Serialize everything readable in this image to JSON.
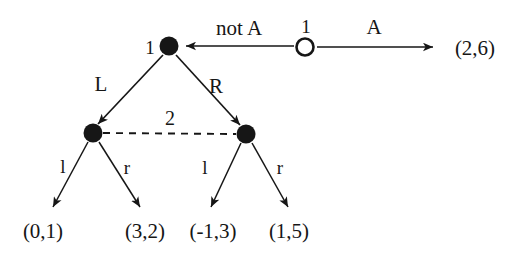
{
  "figure": {
    "name": "extensive-form-game-tree",
    "background_color": "#ffffff",
    "ink_color": "#161616"
  },
  "nodes": [
    {
      "id": "root",
      "name": "root-node-player1",
      "shape": "hollow-circle",
      "player_label": "1",
      "x": 305,
      "y": 47
    },
    {
      "id": "n1",
      "name": "decision-node-player1",
      "shape": "filled-circle",
      "player_label": "1",
      "x": 169,
      "y": 46
    },
    {
      "id": "n2l",
      "name": "decision-node-player2-left",
      "shape": "filled-circle",
      "player_label": "",
      "x": 93,
      "y": 133
    },
    {
      "id": "n2r",
      "name": "decision-node-player2-right",
      "shape": "filled-circle",
      "player_label": "",
      "x": 246,
      "y": 134
    }
  ],
  "edges": [
    {
      "name": "edge-not-a",
      "label": "not A",
      "from": "root",
      "to": "n1"
    },
    {
      "name": "edge-a",
      "label": "A",
      "from": "root",
      "to": "payoff-a"
    },
    {
      "name": "edge-L",
      "label": "L",
      "from": "n1",
      "to": "n2l"
    },
    {
      "name": "edge-R",
      "label": "R",
      "from": "n1",
      "to": "n2r"
    },
    {
      "name": "edge-left-l",
      "label": "l",
      "from": "n2l",
      "to": "payoff-1"
    },
    {
      "name": "edge-left-r",
      "label": "r",
      "from": "n2l",
      "to": "payoff-2"
    },
    {
      "name": "edge-right-l",
      "label": "l",
      "from": "n2r",
      "to": "payoff-3"
    },
    {
      "name": "edge-right-r",
      "label": "r",
      "from": "n2r",
      "to": "payoff-4"
    }
  ],
  "information_set": {
    "name": "information-set-player2",
    "label": "2",
    "style": "dashed",
    "connects": [
      "n2l",
      "n2r"
    ]
  },
  "payoffs": [
    {
      "name": "payoff-a",
      "text": "(2,6)",
      "x": 475,
      "y": 48
    },
    {
      "name": "payoff-1",
      "text": "(0,1)",
      "x": 43,
      "y": 231
    },
    {
      "name": "payoff-2",
      "text": "(3,2)",
      "x": 145,
      "y": 231
    },
    {
      "name": "payoff-3",
      "text": "(-1,3)",
      "x": 213,
      "y": 231
    },
    {
      "name": "payoff-4",
      "text": "(1,5)",
      "x": 289,
      "y": 231
    }
  ],
  "labels": {
    "root_player": "1",
    "n1_player": "1",
    "not_a": "not A",
    "a": "A",
    "L": "L",
    "R": "R",
    "iset": "2",
    "left_l": "l",
    "left_r": "r",
    "right_l": "l",
    "right_r": "r",
    "payoff_a": "(2,6)",
    "payoff_1": "(0,1)",
    "payoff_2": "(3,2)",
    "payoff_3": "(-1,3)",
    "payoff_4": "(1,5)"
  }
}
